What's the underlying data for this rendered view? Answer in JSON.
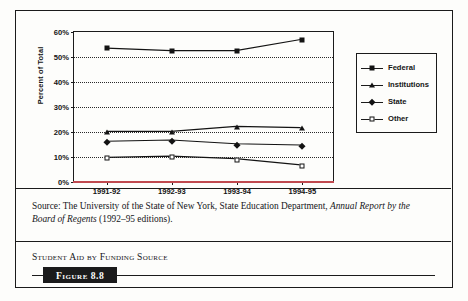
{
  "figure": {
    "tag": "Figure 8.8",
    "caption": "Student Aid by Funding Source",
    "source_prefix": "Source: The University of the State of New York, State Education Department, ",
    "source_italic": "Annual Report by the Board of Regents",
    "source_suffix": " (1992–95 editions)."
  },
  "chart_data": {
    "type": "line",
    "title": "Student Aid by Funding Source",
    "xlabel": "",
    "ylabel": "Percent of Total",
    "categories": [
      "1991-92",
      "1992-93",
      "1993-94",
      "1994-95"
    ],
    "ylim": [
      0,
      60
    ],
    "yticks": [
      0,
      10,
      20,
      30,
      40,
      50,
      60
    ],
    "ytick_labels": [
      "0%",
      "10%",
      "20%",
      "30%",
      "40%",
      "50%",
      "60%"
    ],
    "grid": true,
    "legend_position": "right",
    "series": [
      {
        "name": "Federal",
        "marker": "filled-square",
        "color": "#131313",
        "values": [
          53.5,
          52.5,
          52.5,
          57.0
        ]
      },
      {
        "name": "Institutions",
        "marker": "filled-triangle",
        "color": "#131313",
        "values": [
          20.0,
          20.0,
          22.0,
          21.5
        ]
      },
      {
        "name": "State",
        "marker": "filled-diamond",
        "color": "#131313",
        "values": [
          16.0,
          16.5,
          15.0,
          14.5
        ]
      },
      {
        "name": "Other",
        "marker": "open-square",
        "color": "#131313",
        "values": [
          9.5,
          10.0,
          9.0,
          6.5
        ]
      }
    ]
  },
  "colors": {
    "ink": "#1b1b1b",
    "baseline": "#c0494f",
    "page": "#fdfdfb"
  }
}
